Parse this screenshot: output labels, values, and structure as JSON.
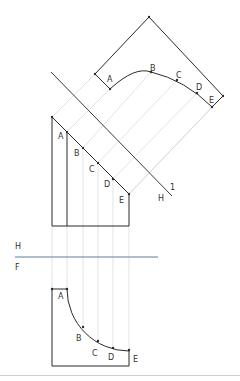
{
  "diagram": {
    "type": "orthographic auxiliary view construction",
    "colors": {
      "object_line": "#2a2a2a",
      "projection_line": "#c9d0d6",
      "fold_line": "#5f7f99",
      "divider": "#d0d0d0"
    },
    "fold_line_hf": {
      "label_above": "H",
      "label_below": "F"
    },
    "fold_line_h1": {
      "label_left": "H",
      "label_right": "1"
    },
    "auxiliary_view": {
      "points": [
        {
          "label": "A"
        },
        {
          "label": "B"
        },
        {
          "label": "C"
        },
        {
          "label": "D"
        },
        {
          "label": "E"
        }
      ]
    },
    "top_view": {
      "points": [
        {
          "label": "A"
        },
        {
          "label": "B"
        },
        {
          "label": "C"
        },
        {
          "label": "D"
        },
        {
          "label": "E"
        }
      ]
    },
    "front_view": {
      "points": [
        {
          "label": "A"
        },
        {
          "label": "B"
        },
        {
          "label": "C"
        },
        {
          "label": "D"
        },
        {
          "label": "E"
        }
      ]
    }
  }
}
